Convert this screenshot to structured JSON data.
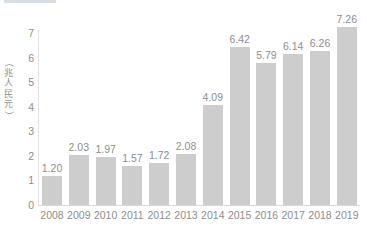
{
  "header": {
    "badge_label": "",
    "title": "",
    "title_visible": false
  },
  "chart_data": {
    "type": "bar",
    "title": "",
    "xlabel": "",
    "ylabel": "（兆人民元）",
    "ylabel_chars": [
      "（",
      "兆",
      "人",
      "民",
      "元",
      "）"
    ],
    "categories": [
      "2008",
      "2009",
      "2010",
      "2011",
      "2012",
      "2013",
      "2014",
      "2015",
      "2016",
      "2017",
      "2018",
      "2019"
    ],
    "values": [
      1.2,
      2.03,
      1.97,
      1.57,
      1.72,
      2.08,
      4.09,
      6.42,
      5.79,
      6.14,
      6.26,
      7.26
    ],
    "value_labels": [
      "1.20",
      "2.03",
      "1.97",
      "1.57",
      "1.72",
      "2.08",
      "4.09",
      "6.42",
      "5.79",
      "6.14",
      "6.26",
      "7.26"
    ],
    "ylim": [
      0,
      7
    ],
    "yticks": [
      0,
      1,
      2,
      3,
      4,
      5,
      6,
      7
    ],
    "ytick_labels": [
      "0",
      "1",
      "2",
      "3",
      "4",
      "5",
      "6",
      "7"
    ],
    "grid": false,
    "legend": null,
    "bar_color": "#cdcdcd",
    "text_color": "#8d8d8d",
    "axis_color": "#d9d9d9"
  }
}
